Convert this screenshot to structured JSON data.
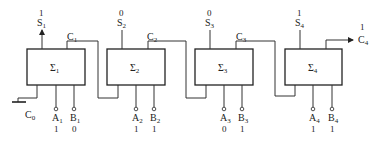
{
  "diagram": {
    "type": "4-bit ripple-carry adder",
    "carry_in": {
      "label": "C",
      "sub": "0"
    },
    "carry_out": {
      "label": "C",
      "sub": "4",
      "value": "1"
    },
    "stages": [
      {
        "sigma": "Σ",
        "index": "1",
        "sum": {
          "label": "S",
          "sub": "1",
          "value": "1"
        },
        "carry": {
          "label": "C",
          "sub": "1"
        },
        "a": {
          "label": "A",
          "sub": "1",
          "value": "1"
        },
        "b": {
          "label": "B",
          "sub": "1",
          "value": "0"
        }
      },
      {
        "sigma": "Σ",
        "index": "2",
        "sum": {
          "label": "S",
          "sub": "2",
          "value": "0"
        },
        "carry": {
          "label": "C",
          "sub": "2"
        },
        "a": {
          "label": "A",
          "sub": "2",
          "value": "1"
        },
        "b": {
          "label": "B",
          "sub": "2",
          "value": "1"
        }
      },
      {
        "sigma": "Σ",
        "index": "3",
        "sum": {
          "label": "S",
          "sub": "3",
          "value": "0"
        },
        "carry": {
          "label": "C",
          "sub": "3"
        },
        "a": {
          "label": "A",
          "sub": "3",
          "value": "0"
        },
        "b": {
          "label": "B",
          "sub": "3",
          "value": "1"
        }
      },
      {
        "sigma": "Σ",
        "index": "4",
        "sum": {
          "label": "S",
          "sub": "4",
          "value": "1"
        },
        "carry": null,
        "a": {
          "label": "A",
          "sub": "4",
          "value": "1"
        },
        "b": {
          "label": "B",
          "sub": "4",
          "value": "1"
        }
      }
    ]
  }
}
